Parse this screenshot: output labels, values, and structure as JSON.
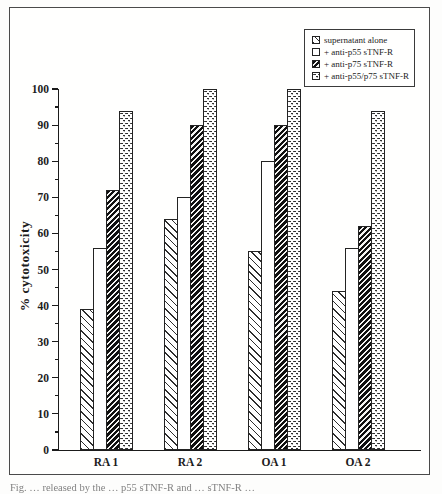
{
  "figure": {
    "caption_fragment": "Fig. … released by the … p55 sTNF-R and … sTNF-R …"
  },
  "chart_data": {
    "type": "bar",
    "title": "",
    "xlabel": "",
    "ylabel": "% cytotoxicity",
    "ylim": [
      0,
      100
    ],
    "ytick_major_step": 10,
    "ytick_minor_step": 5,
    "grid": false,
    "legend_position": "top-right",
    "ink_color": "#1c1c1c",
    "categories": [
      "RA 1",
      "RA 2",
      "OA 1",
      "OA 2"
    ],
    "series": [
      {
        "name": "supernatant alone",
        "pattern": "light-diagonal-hatch",
        "values": [
          39,
          64,
          55,
          44
        ]
      },
      {
        "name": "+ anti-p55 sTNF-R",
        "pattern": "plain",
        "values": [
          56,
          70,
          80,
          56
        ]
      },
      {
        "name": "+ anti-p75 sTNF-R",
        "pattern": "dark-diagonal-hatch",
        "values": [
          72,
          90,
          90,
          62
        ]
      },
      {
        "name": "+ anti-p55/p75 sTNF-R",
        "pattern": "dots",
        "values": [
          94,
          100,
          100,
          94
        ]
      }
    ]
  }
}
